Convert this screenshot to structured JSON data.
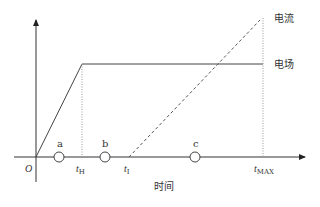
{
  "diagram": {
    "series_labels": {
      "current": "电流",
      "field": "电场"
    },
    "x_axis_label": "时间",
    "origin_label": "O",
    "time_marks": {
      "t_h": {
        "base": "t",
        "sub": "H"
      },
      "t_i": {
        "base": "t",
        "sub": "I"
      },
      "t_max": {
        "base": "t",
        "sub": "MAX"
      }
    },
    "points": [
      {
        "label": "a"
      },
      {
        "label": "b"
      },
      {
        "label": "c"
      }
    ],
    "colors": {
      "line": "#333333",
      "dotted": "#888888"
    }
  }
}
